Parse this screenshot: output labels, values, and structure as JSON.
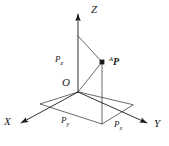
{
  "figure": {
    "stroke_color": "#1a1a1a",
    "background_color": "#ffffff",
    "width": 169,
    "height": 146
  },
  "axes": [
    {
      "name": "z-axis",
      "label": "Z",
      "direction": "up",
      "label_x": 91,
      "label_y": 5
    },
    {
      "name": "x-axis",
      "label": "X",
      "direction": "down-left",
      "label_x": 5,
      "label_y": 117
    },
    {
      "name": "y-axis",
      "label": "Y",
      "direction": "down-right",
      "label_x": 154,
      "label_y": 119
    }
  ],
  "origin": {
    "name": "origin",
    "label": "O",
    "label_x": 63,
    "label_y": 78,
    "point_x": 78,
    "point_y": 92
  },
  "point": {
    "name": "point-P",
    "superscript": "A",
    "symbol": "P",
    "label_x": 110,
    "label_y": 57,
    "point_x": 102,
    "point_y": 62
  },
  "components": [
    {
      "name": "component-pz",
      "symbol": "P",
      "subscript": "z",
      "label_x": 56,
      "label_y": 56
    },
    {
      "name": "component-py",
      "symbol": "P",
      "subscript": "y",
      "label_x": 62,
      "label_y": 117
    },
    {
      "name": "component-px",
      "symbol": "P",
      "subscript": "x",
      "label_x": 115,
      "label_y": 121
    }
  ],
  "geometry": {
    "z_axis_tip": [
      78,
      10
    ],
    "z_axis_foot": [
      78,
      92
    ],
    "x_axis_tip": [
      16,
      126
    ],
    "y_axis_tip": [
      152,
      125
    ],
    "p_projection_xy": [
      102,
      124
    ],
    "plane_corner_left": [
      40,
      104
    ],
    "plane_corner_front": [
      102,
      124
    ],
    "plane_corner_right": [
      133,
      105
    ]
  }
}
